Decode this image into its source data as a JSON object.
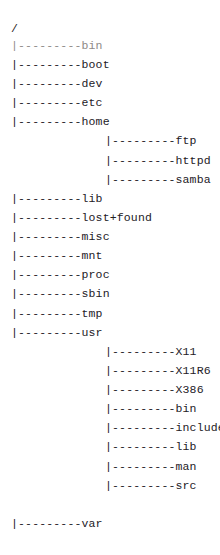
{
  "document": {
    "kind": "ascii-directory-tree",
    "root_label": "/",
    "branch_prefix": "|---------",
    "colors": {
      "background": "#ffffff",
      "text": "#23201f",
      "text_faded": "#8e8a87"
    },
    "rows": [
      {
        "text": "/",
        "level": 0,
        "type": "root",
        "y": 22,
        "faded": false
      },
      {
        "text": "|---------bin",
        "level": 0,
        "type": "branch",
        "y": 44,
        "faded": true
      },
      {
        "text": "|---------boot",
        "level": 0,
        "type": "branch",
        "y": 69,
        "faded": false
      },
      {
        "text": "|---------dev",
        "level": 0,
        "type": "branch",
        "y": 94,
        "faded": false
      },
      {
        "text": "|---------etc",
        "level": 0,
        "type": "branch",
        "y": 119,
        "faded": false
      },
      {
        "text": "|---------home",
        "level": 0,
        "type": "branch",
        "y": 144,
        "faded": false
      },
      {
        "text": "|---------ftp",
        "level": 1,
        "type": "branch",
        "y": 169,
        "faded": false
      },
      {
        "text": "|---------httpd",
        "level": 1,
        "type": "branch",
        "y": 194,
        "faded": false
      },
      {
        "text": "|---------samba",
        "level": 1,
        "type": "branch",
        "y": 219,
        "faded": false
      },
      {
        "text": "|---------lib",
        "level": 0,
        "type": "branch",
        "y": 244,
        "faded": false
      },
      {
        "text": "|---------lost+found",
        "level": 0,
        "type": "branch",
        "y": 269,
        "faded": false
      },
      {
        "text": "|---------misc",
        "level": 0,
        "type": "branch",
        "y": 294,
        "faded": false
      },
      {
        "text": "|---------mnt",
        "level": 0,
        "type": "branch",
        "y": 319,
        "faded": false
      },
      {
        "text": "|---------proc",
        "level": 0,
        "type": "branch",
        "y": 344,
        "faded": false
      },
      {
        "text": "|---------sbin",
        "level": 0,
        "type": "branch",
        "y": 369,
        "faded": false
      },
      {
        "text": "|---------tmp",
        "level": 0,
        "type": "branch",
        "y": 394,
        "faded": false
      },
      {
        "text": "|---------usr",
        "level": 0,
        "type": "branch",
        "y": 419,
        "faded": false
      },
      {
        "text": "|---------X11",
        "level": 1,
        "type": "branch",
        "y": 444,
        "faded": false
      },
      {
        "text": "|---------X11R6",
        "level": 1,
        "type": "branch",
        "y": 469,
        "faded": false
      },
      {
        "text": "|---------X386",
        "level": 1,
        "type": "branch",
        "y": 494,
        "faded": false
      },
      {
        "text": "|---------bin",
        "level": 1,
        "type": "branch",
        "y": 519,
        "faded": false
      },
      {
        "text": "|---------include",
        "level": 1,
        "type": "branch",
        "y": 544,
        "faded": false
      },
      {
        "text": "|---------lib",
        "level": 1,
        "type": "branch",
        "y": 569,
        "faded": false
      },
      {
        "text": "|---------man",
        "level": 1,
        "type": "branch",
        "y": 594,
        "faded": false
      },
      {
        "text": "|---------src",
        "level": 1,
        "type": "branch",
        "y": 619,
        "faded": false
      },
      {
        "text": "|---------var",
        "level": 0,
        "type": "branch",
        "y": 669,
        "faded": false
      }
    ],
    "entries": [
      "bin",
      "boot",
      "dev",
      "etc",
      "home",
      "ftp",
      "httpd",
      "samba",
      "lib",
      "lost+found",
      "misc",
      "mnt",
      "proc",
      "sbin",
      "tmp",
      "usr",
      "X11",
      "X11R6",
      "X386",
      "bin",
      "include",
      "lib",
      "man",
      "src",
      "var"
    ]
  }
}
